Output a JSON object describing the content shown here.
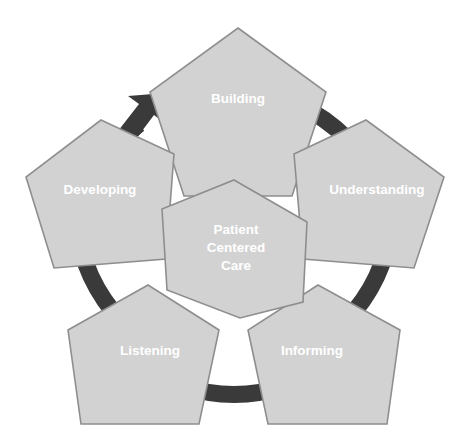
{
  "diagram": {
    "title": "Patient Centered Care",
    "type": "cycle-pentagon-diagram",
    "canvas": {
      "width": 469,
      "height": 447,
      "background": "#ffffff"
    },
    "colors": {
      "pentagon_fill": "#d2d2d2",
      "pentagon_stroke": "#8e8e8e",
      "ring": "#3a3a3a",
      "label_text": "#ffffff",
      "background": "#ffffff"
    },
    "center": {
      "label": "Patient Centered Care",
      "lines": [
        "Patient",
        "Centered",
        "Care"
      ]
    },
    "nodes": [
      {
        "id": "building",
        "label": "Building",
        "position": "top",
        "order": 1
      },
      {
        "id": "understanding",
        "label": "Understanding",
        "position": "right",
        "order": 2
      },
      {
        "id": "informing",
        "label": "Informing",
        "position": "bottom-right",
        "order": 3
      },
      {
        "id": "listening",
        "label": "Listening",
        "position": "bottom-left",
        "order": 4
      },
      {
        "id": "developing",
        "label": "Developing",
        "position": "left",
        "order": 5
      }
    ],
    "ring": {
      "description": "broken dark circular arrow running clockwise behind the pentagons",
      "arrow_head": "top-left pointing clockwise toward Building"
    }
  }
}
